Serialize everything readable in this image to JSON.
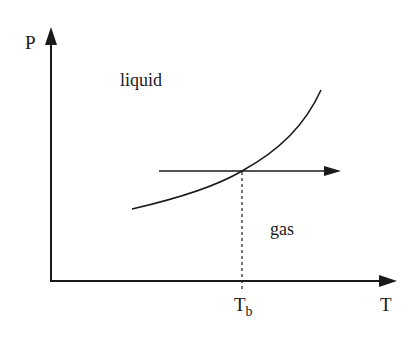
{
  "diagram": {
    "type": "phase-diagram",
    "axes": {
      "y_label": "P",
      "x_label": "T"
    },
    "regions": {
      "upper": "liquid",
      "lower": "gas"
    },
    "marker": {
      "label_main": "T",
      "label_sub": "b"
    },
    "colors": {
      "stroke": "#1a1a1a",
      "background": "#ffffff"
    }
  }
}
